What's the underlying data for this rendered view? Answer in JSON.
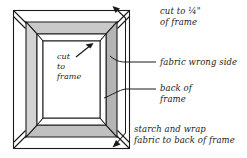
{
  "figure": {
    "kind": "instructional-line-diagram",
    "colors": {
      "background": "#ffffff",
      "ink": "#1a1a1a",
      "frame_band_light": "#d2d2d2",
      "frame_band_mid": "#bfbfbf",
      "frame_band_dark": "#a8a8a8",
      "fabric_field": "#ffffff"
    }
  },
  "labels": {
    "cut_quarter": "cut to ¼\"\nof frame",
    "fabric_wrong_side": "fabric wrong side",
    "back_of_frame": "back of\nframe",
    "starch_and_wrap": "starch and wrap\nfabric to back of frame",
    "cut_to_frame": "cut\nto\nframe"
  },
  "annotations": {
    "leader_vertical": "vertical leader line at right of frame",
    "arrow_top": "arrow pointing up-left to fabric corner",
    "arrow_bottom": "arrow pointing down-left to fabric corner",
    "arrow_inner": "diagonal arrow pointing up-right to inner frame opening",
    "corner_diagonals": "mitre diagonals at the four fabric corners"
  }
}
